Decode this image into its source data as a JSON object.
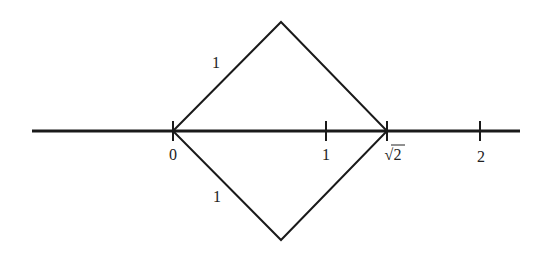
{
  "diagram": {
    "title": "",
    "colors": {
      "stroke": "#1a1a1a",
      "background": "#ffffff",
      "text": "#222222"
    },
    "axis": {
      "ticks": [
        {
          "value": 0,
          "label": "0"
        },
        {
          "value": 1,
          "label": "1"
        },
        {
          "value": 1.41421,
          "label": "√2"
        },
        {
          "value": 2,
          "label": "2"
        }
      ]
    },
    "square": {
      "side_labels": {
        "upper_left": "1",
        "lower_left": "1"
      }
    }
  }
}
